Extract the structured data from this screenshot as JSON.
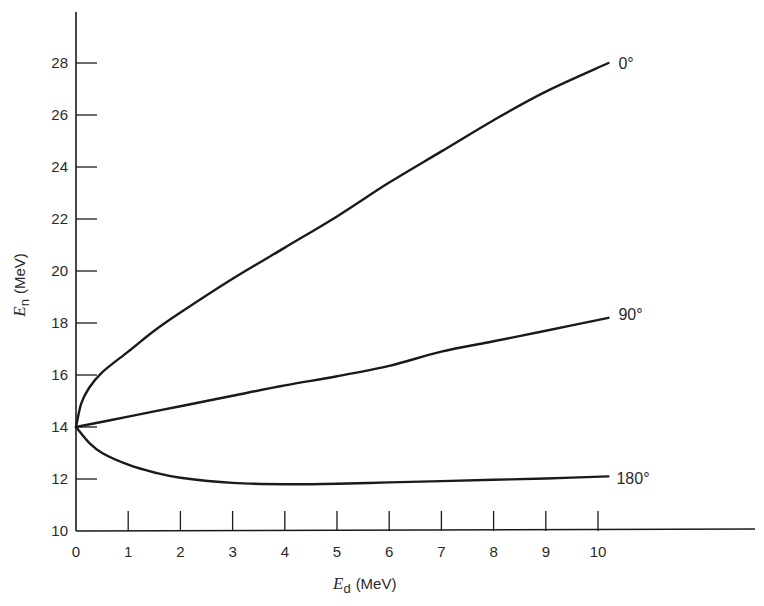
{
  "chart_data": {
    "type": "line",
    "title": "",
    "xlabel": {
      "symbol": "E",
      "subscript": "d",
      "unit": "(MeV)"
    },
    "ylabel": {
      "symbol": "E",
      "subscript": "n",
      "unit": "(MeV)"
    },
    "xlim": [
      0,
      13.2
    ],
    "ylim": [
      10,
      29.8
    ],
    "x_ticks": [
      0,
      1,
      2,
      3,
      4,
      5,
      6,
      7,
      8,
      9,
      10
    ],
    "x_tick_labels": [
      "0",
      "1",
      "2",
      "3",
      "4",
      "5",
      "6",
      "7",
      "8",
      "9",
      "10"
    ],
    "y_ticks": [
      10,
      12,
      14,
      16,
      18,
      20,
      22,
      24,
      26,
      28
    ],
    "y_tick_labels": [
      "10",
      "12",
      "14",
      "16",
      "18",
      "20",
      "22",
      "24",
      "26",
      "28"
    ],
    "grid": false,
    "legend": "inline labels at right end of each curve",
    "series": [
      {
        "name": "0°",
        "label": "0°",
        "x": [
          0,
          0.1,
          0.25,
          0.5,
          1,
          1.5,
          2,
          3,
          4,
          5,
          6,
          7,
          8,
          9,
          10.2
        ],
        "y": [
          14.0,
          14.9,
          15.5,
          16.1,
          16.9,
          17.7,
          18.4,
          19.7,
          20.9,
          22.1,
          23.4,
          24.6,
          25.8,
          26.9,
          28.0
        ]
      },
      {
        "name": "90°",
        "label": "90°",
        "x": [
          0,
          1,
          2,
          3,
          4,
          5,
          6,
          7,
          8,
          9,
          10.2
        ],
        "y": [
          14.0,
          14.4,
          14.8,
          15.2,
          15.6,
          15.95,
          16.35,
          16.9,
          17.3,
          17.7,
          18.2
        ]
      },
      {
        "name": "180°",
        "label": "180°",
        "x": [
          0,
          0.25,
          0.5,
          1,
          1.5,
          2,
          3,
          4,
          5,
          6,
          7,
          8,
          9,
          10.2
        ],
        "y": [
          14.0,
          13.4,
          13.0,
          12.55,
          12.25,
          12.05,
          11.85,
          11.8,
          11.82,
          11.87,
          11.92,
          11.97,
          12.02,
          12.1
        ]
      }
    ]
  },
  "colors": {
    "ink": "#1a1a1a",
    "background": "#ffffff"
  }
}
